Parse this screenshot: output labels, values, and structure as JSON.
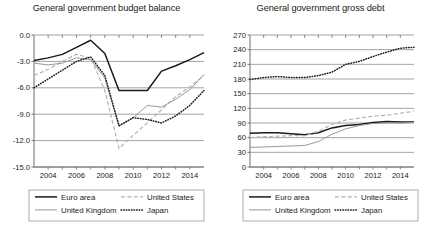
{
  "figure": {
    "panels": [
      {
        "id": "budget-balance",
        "title": "General government budget balance",
        "legend": {
          "entries": [
            {
              "label": "Euro area",
              "style": "solid-black"
            },
            {
              "label": "United States",
              "style": "dashed-gray"
            },
            {
              "label": "United Kingdom",
              "style": "solid-gray"
            },
            {
              "label": "Japan",
              "style": "dotted-black"
            }
          ]
        }
      },
      {
        "id": "gross-debt",
        "title": "General government gross debt",
        "legend": {
          "entries": [
            {
              "label": "Euro area",
              "style": "solid-black"
            },
            {
              "label": "United States",
              "style": "dashed-gray"
            },
            {
              "label": "United Kingdom",
              "style": "solid-gray"
            },
            {
              "label": "Japan",
              "style": "dotted-black"
            }
          ]
        }
      }
    ]
  },
  "colors": {
    "euro_area": "#1a1a1a",
    "united_states": "#b3b3b3",
    "united_kingdom": "#9a9a9a",
    "japan": "#1a1a1a",
    "gridline": "#8c8c8c",
    "axis": "#6e6e6e",
    "text": "#1a1a1a",
    "legend_border": "#9a9a9a",
    "background": "#ffffff"
  },
  "chart_data": [
    {
      "type": "line",
      "title": "General government budget balance",
      "xlabel": "",
      "ylabel": "",
      "grid": true,
      "legend_position": "below",
      "x": [
        2003,
        2004,
        2005,
        2006,
        2007,
        2008,
        2009,
        2010,
        2011,
        2012,
        2013,
        2014,
        2015
      ],
      "xtick_labels": [
        "2004",
        "2006",
        "2008",
        "2010",
        "2012",
        "2014"
      ],
      "xticks": [
        2004,
        2006,
        2008,
        2010,
        2012,
        2014
      ],
      "xlim": [
        2003,
        2015
      ],
      "ytick_labels": [
        "0.0",
        "-3.0",
        "-6.0",
        "-9.0",
        "-12.0",
        "-15.0"
      ],
      "yticks": [
        0.0,
        -3.0,
        -6.0,
        -9.0,
        -12.0,
        -15.0
      ],
      "ylim": [
        -15.0,
        0.0
      ],
      "series": [
        {
          "name": "Euro area",
          "values": [
            -2.9,
            -2.6,
            -2.2,
            -1.4,
            -0.6,
            -2.1,
            -6.3,
            -6.3,
            -6.3,
            -4.1,
            -3.5,
            -2.8,
            -2.0
          ]
        },
        {
          "name": "United States",
          "values": [
            -4.6,
            -3.9,
            -3.0,
            -2.2,
            -2.6,
            -6.3,
            -12.9,
            -11.4,
            -10.0,
            -8.5,
            -7.0,
            -5.9,
            -4.6
          ]
        },
        {
          "name": "United Kingdom",
          "values": [
            -3.2,
            -3.4,
            -3.2,
            -2.6,
            -2.8,
            -4.9,
            -10.4,
            -9.4,
            -8.0,
            -8.2,
            -7.3,
            -6.2,
            -4.5
          ]
        },
        {
          "name": "Japan",
          "values": [
            -6.0,
            -5.0,
            -4.0,
            -3.0,
            -2.5,
            -4.6,
            -10.3,
            -9.4,
            -9.6,
            -10.0,
            -9.2,
            -8.0,
            -6.3
          ]
        }
      ]
    },
    {
      "type": "line",
      "title": "General government gross debt",
      "xlabel": "",
      "ylabel": "",
      "grid": true,
      "legend_position": "below",
      "x": [
        2003,
        2004,
        2005,
        2006,
        2007,
        2008,
        2009,
        2010,
        2011,
        2012,
        2013,
        2014,
        2015
      ],
      "xtick_labels": [
        "2004",
        "2006",
        "2008",
        "2010",
        "2012",
        "2014"
      ],
      "xticks": [
        2004,
        2006,
        2008,
        2010,
        2012,
        2014
      ],
      "xlim": [
        2003,
        2015
      ],
      "ytick_labels": [
        "270",
        "240",
        "210",
        "180",
        "150",
        "120",
        "90",
        "60",
        "30",
        "0"
      ],
      "yticks": [
        270,
        240,
        210,
        180,
        150,
        120,
        90,
        60,
        30,
        0
      ],
      "ylim": [
        0,
        270
      ],
      "series": [
        {
          "name": "Euro area",
          "values": [
            69,
            70,
            70,
            68,
            66,
            70,
            80,
            85,
            87,
            91,
            93,
            92,
            92
          ]
        },
        {
          "name": "United States",
          "values": [
            60,
            62,
            63,
            64,
            64,
            73,
            87,
            96,
            100,
            104,
            106,
            110,
            114
          ]
        },
        {
          "name": "United Kingdom",
          "values": [
            40,
            41,
            42,
            43,
            44,
            52,
            67,
            78,
            85,
            89,
            90,
            90,
            91
          ]
        },
        {
          "name": "Japan",
          "values": [
            179,
            183,
            185,
            183,
            183,
            187,
            194,
            210,
            216,
            226,
            235,
            243,
            245
          ]
        }
      ]
    }
  ]
}
